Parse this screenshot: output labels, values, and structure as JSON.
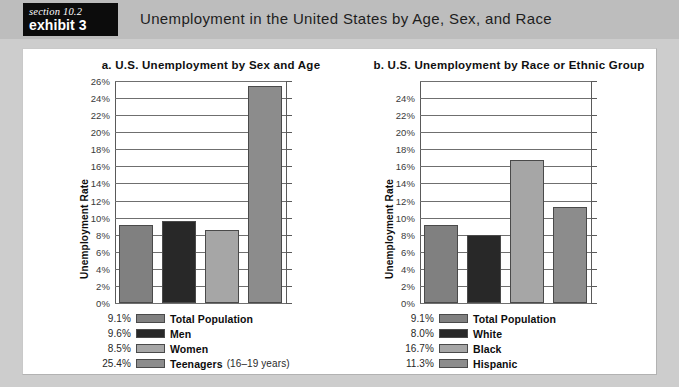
{
  "header": {
    "section_label": "section 10.2",
    "exhibit_label": "exhibit 3",
    "title": "Unemployment in the United States by Age, Sex, and Race"
  },
  "colors": {
    "header_bg": "#bdbdbd",
    "tab_bg": "#0c0c0c",
    "page_bg": "#cdcdcd",
    "panel_bg": "#ffffff",
    "bar_total": "#808080",
    "bar_dark": "#282828",
    "bar_light": "#a6a6a6",
    "bar_medium": "#8c8c8c",
    "gridline": "#6f6f6f"
  },
  "chart_data": [
    {
      "type": "bar",
      "id": "a",
      "title": "a.  U.S. Unemployment by Sex and Age",
      "xlabel": "",
      "ylabel": "Unemployment Rate",
      "ylim": [
        0,
        26
      ],
      "ytick_labels": [
        "26%",
        "24%",
        "22%",
        "20%",
        "18%",
        "16%",
        "14%",
        "12%",
        "10%",
        "8%",
        "6%",
        "4%",
        "2%",
        "0%"
      ],
      "ytick_values": [
        26,
        24,
        22,
        20,
        18,
        16,
        14,
        12,
        10,
        8,
        6,
        4,
        2,
        0
      ],
      "grid": true,
      "legend_position": "below",
      "categories": [
        "Total Population",
        "Men",
        "Women",
        "Teenagers"
      ],
      "values": [
        9.1,
        9.6,
        8.5,
        25.4
      ],
      "value_labels": [
        "9.1%",
        "9.6%",
        "8.5%",
        "25.4%"
      ],
      "bar_colors": [
        "#808080",
        "#282828",
        "#a6a6a6",
        "#8c8c8c"
      ],
      "legend": [
        {
          "value": "9.1%",
          "label": "Total Population",
          "note": "",
          "color": "#808080"
        },
        {
          "value": "9.6%",
          "label": "Men",
          "note": "",
          "color": "#282828"
        },
        {
          "value": "8.5%",
          "label": "Women",
          "note": "",
          "color": "#a6a6a6"
        },
        {
          "value": "25.4%",
          "label": "Teenagers",
          "note": "(16–19 years)",
          "color": "#8c8c8c"
        }
      ]
    },
    {
      "type": "bar",
      "id": "b",
      "title": "b.  U.S. Unemployment by Race or Ethnic Group",
      "xlabel": "",
      "ylabel": "Unemployment Rate",
      "ylim": [
        0,
        26
      ],
      "ytick_labels": [
        "",
        "24%",
        "22%",
        "20%",
        "18%",
        "16%",
        "14%",
        "12%",
        "10%",
        "8%",
        "6%",
        "4%",
        "2%",
        "0%"
      ],
      "ytick_values": [
        26,
        24,
        22,
        20,
        18,
        16,
        14,
        12,
        10,
        8,
        6,
        4,
        2,
        0
      ],
      "grid": true,
      "legend_position": "below",
      "categories": [
        "Total Population",
        "White",
        "Black",
        "Hispanic"
      ],
      "values": [
        9.1,
        8.0,
        16.7,
        11.3
      ],
      "value_labels": [
        "9.1%",
        "8.0%",
        "16.7%",
        "11.3%"
      ],
      "bar_colors": [
        "#808080",
        "#282828",
        "#a6a6a6",
        "#8c8c8c"
      ],
      "legend": [
        {
          "value": "9.1%",
          "label": "Total Population",
          "note": "",
          "color": "#808080"
        },
        {
          "value": "8.0%",
          "label": "White",
          "note": "",
          "color": "#282828"
        },
        {
          "value": "16.7%",
          "label": "Black",
          "note": "",
          "color": "#a6a6a6"
        },
        {
          "value": "11.3%",
          "label": "Hispanic",
          "note": "",
          "color": "#8c8c8c"
        }
      ]
    }
  ]
}
